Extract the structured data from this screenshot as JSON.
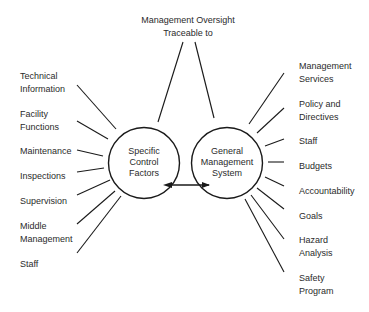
{
  "top": {
    "line1": "Management Oversight",
    "line2": "Traceable to"
  },
  "left_circle": {
    "lines": [
      "Specific",
      "Control",
      "Factors"
    ]
  },
  "right_circle": {
    "lines": [
      "General",
      "Management",
      "System"
    ]
  },
  "left_items": [
    {
      "lines": [
        "Technical",
        "Information"
      ]
    },
    {
      "lines": [
        "Facility",
        "Functions"
      ]
    },
    {
      "lines": [
        "Maintenance"
      ]
    },
    {
      "lines": [
        "Inspections"
      ]
    },
    {
      "lines": [
        "Supervision"
      ]
    },
    {
      "lines": [
        "Middle",
        "Management"
      ]
    },
    {
      "lines": [
        "Staff"
      ]
    }
  ],
  "right_items": [
    {
      "lines": [
        "Management",
        "Services"
      ]
    },
    {
      "lines": [
        "Policy and",
        "Directives"
      ]
    },
    {
      "lines": [
        "Staff"
      ]
    },
    {
      "lines": [
        "Budgets"
      ]
    },
    {
      "lines": [
        "Accountability"
      ]
    },
    {
      "lines": [
        "Goals"
      ]
    },
    {
      "lines": [
        "Hazard",
        "Analysis"
      ]
    },
    {
      "lines": [
        "Safety",
        "Program"
      ]
    }
  ],
  "colors": {
    "stroke": "#1a1a1a",
    "text": "#2b2b2b",
    "background": "#ffffff"
  }
}
